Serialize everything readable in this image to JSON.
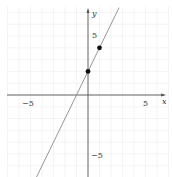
{
  "chart_data": {
    "type": "line",
    "title": "",
    "xlabel": "x",
    "ylabel": "y",
    "xlim": [
      -7,
      7
    ],
    "ylim": [
      -7,
      7.5
    ],
    "grid": true,
    "x_tick_labels": [
      "-5",
      "5"
    ],
    "y_tick_labels": [
      "5",
      "-5"
    ],
    "series": [
      {
        "name": "line",
        "equation": "y = 2x + 2",
        "x": [
          -4.5,
          2.7
        ],
        "y": [
          -7,
          7.4
        ],
        "color": "#8a8a8a"
      }
    ],
    "points": [
      {
        "x": 0,
        "y": 2
      },
      {
        "x": 1,
        "y": 4
      }
    ]
  },
  "axes": {
    "x_label": "x",
    "y_label": "y",
    "x_neg_tick": "−5",
    "x_pos_tick": "5",
    "y_pos_tick": "5",
    "y_neg_tick": "−5"
  },
  "colors": {
    "grid": "#ececec",
    "axis": "#555555",
    "line": "#8a8a8a",
    "point": "#111111"
  }
}
